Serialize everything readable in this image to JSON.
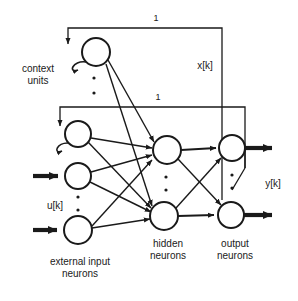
{
  "figure": {
    "type": "neural-network-diagram",
    "background_color": "#ffffff",
    "ink_color": "#1a1a1a"
  },
  "labels": {
    "context_units": "context\nunits",
    "external_input_neurons": "external input\nneurons",
    "hidden_neurons": "hidden\nneurons",
    "output_neurons": "output\nneurons",
    "state_signal": "x[k]",
    "input_signal": "u[k]",
    "output_signal": "y[k]",
    "feedback_weight_top": "1",
    "feedback_weight_bottom": "1"
  },
  "layers": [
    {
      "name": "context-units",
      "count_shown": 2,
      "ellipsis": "vertical-dots",
      "self_recurrent": true,
      "nodes": [
        {
          "id": "c1",
          "cx": 96,
          "cy": 52,
          "r": 14
        },
        {
          "id": "c2",
          "cx": 78,
          "cy": 134,
          "r": 13
        }
      ]
    },
    {
      "name": "external-input-neurons",
      "count_shown": 2,
      "ellipsis": "vertical-dots",
      "nodes": [
        {
          "id": "i1",
          "cx": 78,
          "cy": 176,
          "r": 13
        },
        {
          "id": "i2",
          "cx": 78,
          "cy": 230,
          "r": 14
        }
      ]
    },
    {
      "name": "hidden-neurons",
      "count_shown": 2,
      "ellipsis": "vertical-dots",
      "nodes": [
        {
          "id": "h1",
          "cx": 167,
          "cy": 150,
          "r": 14
        },
        {
          "id": "h2",
          "cx": 164,
          "cy": 216,
          "r": 14
        }
      ]
    },
    {
      "name": "output-neurons",
      "count_shown": 2,
      "ellipsis": "vertical-dots",
      "nodes": [
        {
          "id": "o1",
          "cx": 232,
          "cy": 148,
          "r": 13
        },
        {
          "id": "o2",
          "cx": 231,
          "cy": 215,
          "r": 13
        }
      ]
    }
  ],
  "feedback_paths": [
    {
      "from": "hidden-layer-tap",
      "to": "context-unit-1",
      "weight": "1"
    },
    {
      "from": "hidden-layer-tap",
      "to": "context-unit-2",
      "weight": "1"
    }
  ]
}
